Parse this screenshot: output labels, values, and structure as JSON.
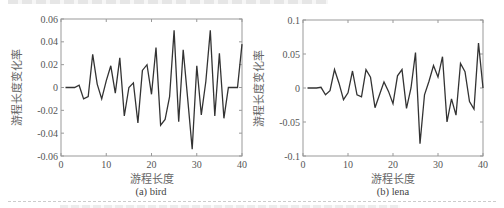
{
  "chart_data": [
    {
      "type": "line",
      "title": "(a) bird",
      "xlabel": "游程长度",
      "ylabel": "游程长度变化率",
      "xlim": [
        0,
        40
      ],
      "ylim": [
        -0.06,
        0.06
      ],
      "xticks": [
        0,
        10,
        20,
        30,
        40
      ],
      "yticks": [
        -0.06,
        -0.04,
        -0.02,
        0,
        0.02,
        0.04,
        0.06
      ],
      "ytick_labels": [
        "-0.06",
        "-0.04",
        "-0.02",
        "0",
        "0.02",
        "0.04",
        "0.06"
      ],
      "grid": false,
      "legend": null,
      "x": [
        1,
        2,
        3,
        4,
        5,
        6,
        7,
        8,
        9,
        10,
        11,
        12,
        13,
        14,
        15,
        16,
        17,
        18,
        19,
        20,
        21,
        22,
        23,
        24,
        25,
        26,
        27,
        28,
        29,
        30,
        31,
        32,
        33,
        34,
        35,
        36,
        37,
        38,
        39,
        40
      ],
      "values": [
        0,
        0,
        0,
        0.002,
        -0.01,
        -0.008,
        0.029,
        0.003,
        -0.01,
        0.006,
        0.019,
        -0.005,
        0.026,
        -0.025,
        0,
        0.004,
        -0.031,
        0.015,
        0.02,
        -0.006,
        0.035,
        -0.033,
        -0.028,
        -0.008,
        0.05,
        -0.03,
        0.033,
        -0.01,
        -0.054,
        0.019,
        -0.024,
        0.005,
        0.05,
        -0.025,
        0.03,
        -0.027,
        0,
        0,
        0,
        0.038
      ]
    },
    {
      "type": "line",
      "title": "(b) lena",
      "xlabel": "游程长度",
      "ylabel": "游程长度变化率",
      "xlim": [
        0,
        40
      ],
      "ylim": [
        -0.1,
        0.1
      ],
      "xticks": [
        0,
        10,
        20,
        30,
        40
      ],
      "yticks": [
        -0.1,
        -0.05,
        0,
        0.05,
        0.1
      ],
      "ytick_labels": [
        "-0.1",
        "-0.05",
        "0",
        "0.05",
        "0.1"
      ],
      "grid": false,
      "legend": null,
      "x": [
        1,
        2,
        3,
        4,
        5,
        6,
        7,
        8,
        9,
        10,
        11,
        12,
        13,
        14,
        15,
        16,
        17,
        18,
        19,
        20,
        21,
        22,
        23,
        24,
        25,
        26,
        27,
        28,
        29,
        30,
        31,
        32,
        33,
        34,
        35,
        36,
        37,
        38,
        39,
        40
      ],
      "values": [
        0,
        0,
        0,
        0.001,
        -0.01,
        -0.004,
        0.027,
        0.007,
        -0.017,
        -0.007,
        0.025,
        -0.01,
        -0.013,
        0.027,
        0.016,
        -0.029,
        -0.01,
        0.009,
        -0.005,
        -0.023,
        0.018,
        0.027,
        -0.03,
        0,
        0.052,
        -0.082,
        -0.01,
        0.01,
        0.033,
        0.016,
        0.046,
        -0.05,
        -0.016,
        -0.04,
        0.036,
        0.024,
        -0.02,
        -0.031,
        0.066,
        0
      ]
    }
  ],
  "layout": [
    {
      "box": [
        61,
        19,
        242,
        156
      ],
      "caption_x": 91
    },
    {
      "box": [
        303,
        20,
        483,
        156
      ],
      "caption_x": 333
    }
  ],
  "colors": {
    "line": "#333333",
    "axis": "#999999",
    "text": "#555555"
  }
}
